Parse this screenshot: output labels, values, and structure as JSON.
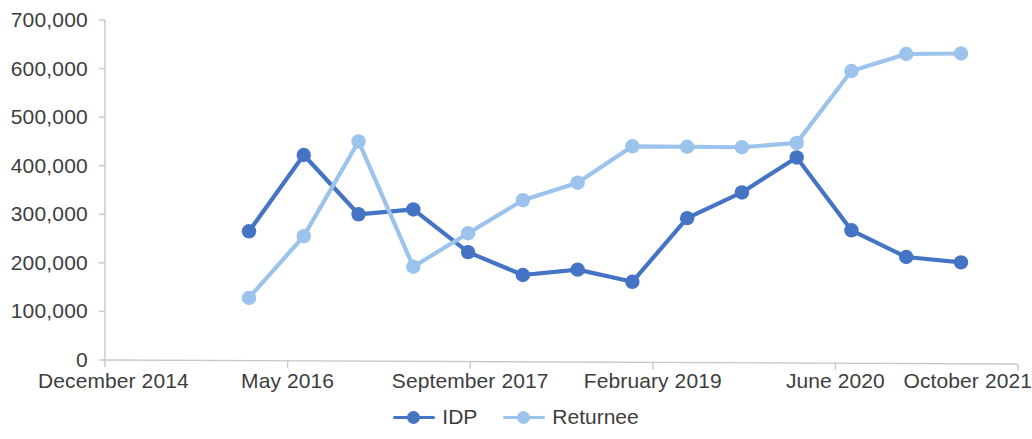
{
  "chart_data": {
    "type": "line",
    "title": "",
    "xlabel": "",
    "ylabel": "",
    "ylim": [
      0,
      700000
    ],
    "grid": false,
    "legend_position": "bottom-center",
    "x_tick_labels": [
      "December 2014",
      "May 2016",
      "September 2017",
      "February 2019",
      "June 2020",
      "October 2021"
    ],
    "y_tick_labels": [
      "0",
      "100,000",
      "200,000",
      "300,000",
      "400,000",
      "500,000",
      "600,000",
      "700,000"
    ],
    "y_tick_values": [
      0,
      100000,
      200000,
      300000,
      400000,
      500000,
      600000,
      700000
    ],
    "x": [
      1,
      2,
      3,
      4,
      5,
      6,
      7,
      8,
      9,
      10,
      11,
      12,
      13,
      14
    ],
    "series": [
      {
        "name": "IDP",
        "color": "#4574C4",
        "values": [
          265000,
          422000,
          300000,
          310000,
          222000,
          175000,
          186000,
          161000,
          292000,
          345000,
          417000,
          267000,
          212000,
          201000
        ]
      },
      {
        "name": "Returnee",
        "color": "#9CC3EB",
        "values": [
          128000,
          255000,
          450000,
          192000,
          261000,
          329000,
          365000,
          440000,
          439000,
          438000,
          447000,
          595000,
          630000,
          631000
        ]
      }
    ]
  },
  "axis": {
    "line_color": "#c8c8c8",
    "label_color": "#3d3d3d"
  },
  "legend": {
    "items": [
      {
        "label": "IDP",
        "color": "#4574C4"
      },
      {
        "label": "Returnee",
        "color": "#9CC3EB"
      }
    ]
  }
}
